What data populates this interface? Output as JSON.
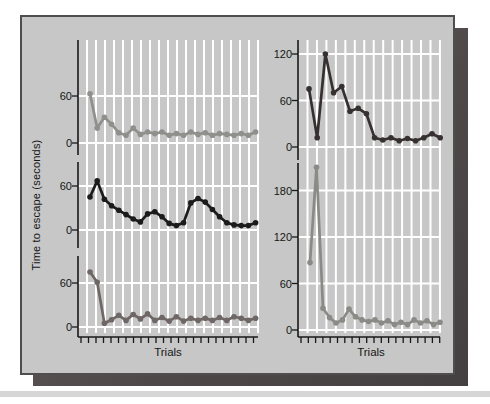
{
  "chart_data": {
    "type": "line",
    "title": "",
    "xlabel": "Trials",
    "ylabel": "Time to escape (seconds)",
    "grid": true,
    "legend": "none",
    "marker": "dot",
    "panels": [
      {
        "name": "top-left",
        "color": "#8f8f8b",
        "yticks": [
          60,
          0
        ],
        "ylim": [
          0,
          80
        ],
        "values": [
          63,
          19,
          33,
          24,
          13,
          10,
          19,
          11,
          14,
          12,
          14,
          10,
          12,
          10,
          14,
          11,
          13,
          10,
          12,
          11,
          10,
          12,
          10,
          14
        ]
      },
      {
        "name": "middle-left",
        "color": "#1b1b1b",
        "yticks": [
          60,
          0
        ],
        "ylim": [
          0,
          80
        ],
        "values": [
          45,
          67,
          42,
          33,
          27,
          21,
          15,
          11,
          22,
          25,
          18,
          9,
          6,
          10,
          37,
          43,
          38,
          28,
          18,
          10,
          7,
          6,
          6,
          10
        ]
      },
      {
        "name": "bottom-left",
        "color": "#6e6765",
        "yticks": [
          60,
          0
        ],
        "ylim": [
          0,
          80
        ],
        "values": [
          75,
          61,
          5,
          10,
          16,
          9,
          17,
          11,
          18,
          9,
          13,
          8,
          14,
          8,
          12,
          9,
          12,
          9,
          13,
          9,
          14,
          12,
          9,
          12
        ]
      },
      {
        "name": "top-right",
        "color": "#363030",
        "yticks": [
          120,
          60,
          0
        ],
        "ylim": [
          0,
          140
        ],
        "values": [
          75,
          12,
          120,
          70,
          78,
          46,
          50,
          43,
          12,
          9,
          12,
          8,
          11,
          8,
          12,
          17,
          12
        ]
      },
      {
        "name": "bottom-right",
        "color": "#8a8a87",
        "yticks": [
          180,
          120,
          60,
          0
        ],
        "ylim": [
          0,
          215
        ],
        "values": [
          87,
          210,
          28,
          16,
          9,
          13,
          27,
          17,
          13,
          11,
          13,
          9,
          12,
          7,
          10,
          7,
          13,
          9,
          12,
          7,
          10
        ]
      }
    ]
  },
  "colors": {
    "panel_bg": "#c6c7c6",
    "panel_border": "#4f4d4d",
    "grid_line": "#ffffff",
    "axis": "#181818",
    "tick_label": "#161616",
    "shadow": "#4e4849",
    "page_band": "#d5d6d5"
  }
}
